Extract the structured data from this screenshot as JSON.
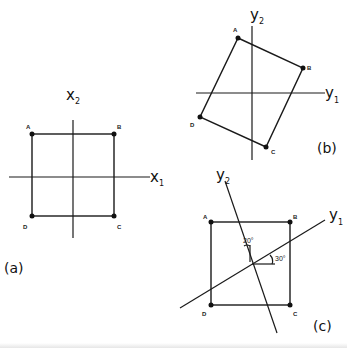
{
  "panels": {
    "a": {
      "label": "(a)",
      "axes": {
        "x1": "x",
        "x1_sub": "1",
        "x2": "x",
        "x2_sub": "2"
      },
      "vertices": {
        "A": "A",
        "B": "B",
        "C": "C",
        "D": "D"
      }
    },
    "b": {
      "label": "(b)",
      "axes": {
        "y1": "y",
        "y1_sub": "1",
        "y2": "y",
        "y2_sub": "2"
      },
      "vertices": {
        "A": "A",
        "B": "B",
        "C": "C",
        "D": "D"
      }
    },
    "c": {
      "label": "(c)",
      "axes": {
        "y1": "y",
        "y1_sub": "1",
        "y2": "y",
        "y2_sub": "2"
      },
      "vertices": {
        "A": "A",
        "B": "B",
        "C": "C",
        "D": "D"
      },
      "angles": {
        "y2_angle": "20°",
        "y1_angle": "30°"
      }
    }
  },
  "colors": {
    "ink": "#1a1a1a",
    "background": "#ffffff"
  }
}
